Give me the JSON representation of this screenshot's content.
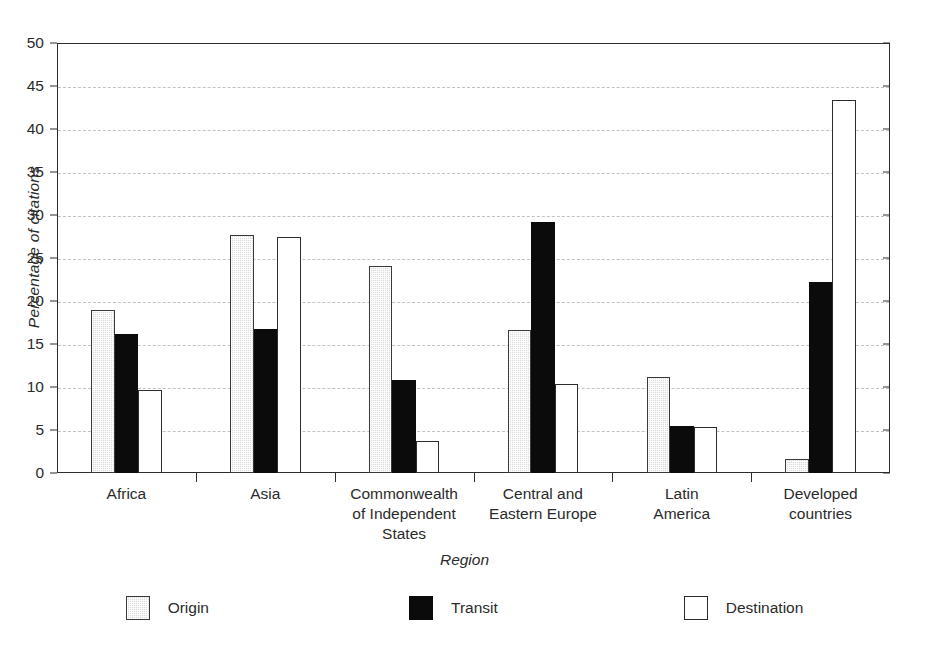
{
  "chart_data": {
    "type": "bar",
    "title": "",
    "xlabel": "Region",
    "ylabel": "Percentage of citations",
    "ylim": [
      0,
      50
    ],
    "ytick_step": 5,
    "yticks": [
      0,
      5,
      10,
      15,
      20,
      25,
      30,
      35,
      40,
      45,
      50
    ],
    "grid": "horizontal-dashed",
    "legend_position": "bottom-center",
    "categories": [
      "Africa",
      "Commonwealth of Independent States",
      "Asia",
      "Central and Eastern Europe",
      "Latin America",
      "Developed countries"
    ],
    "category_lines": [
      [
        "Africa"
      ],
      [
        "Asia"
      ],
      [
        "Commonwealth",
        "of Independent",
        "States"
      ],
      [
        "Central and",
        "Eastern Europe"
      ],
      [
        "Latin",
        "America"
      ],
      [
        "Developed",
        "countries"
      ]
    ],
    "series": [
      {
        "name": "Origin",
        "color": "#dcdcdc",
        "style": "light-gray-stipple",
        "values": [
          19.0,
          27.7,
          24.1,
          16.6,
          11.2,
          1.6
        ]
      },
      {
        "name": "Transit",
        "color": "#0b0b0b",
        "style": "solid-black",
        "values": [
          16.2,
          16.7,
          10.8,
          29.2,
          5.5,
          22.2
        ]
      },
      {
        "name": "Destination",
        "color": "#ffffff",
        "style": "white-outlined",
        "values": [
          9.7,
          27.5,
          3.7,
          10.4,
          5.3,
          43.4
        ]
      }
    ]
  },
  "axis": {
    "y_title": "Percentage of citations",
    "x_title": "Region",
    "y_tick_labels": [
      "50",
      "45",
      "40",
      "35",
      "30",
      "25",
      "20",
      "15",
      "10",
      "5",
      "0"
    ]
  },
  "legend": {
    "items": [
      {
        "label": "Origin"
      },
      {
        "label": "Transit"
      },
      {
        "label": "Destination"
      }
    ]
  }
}
